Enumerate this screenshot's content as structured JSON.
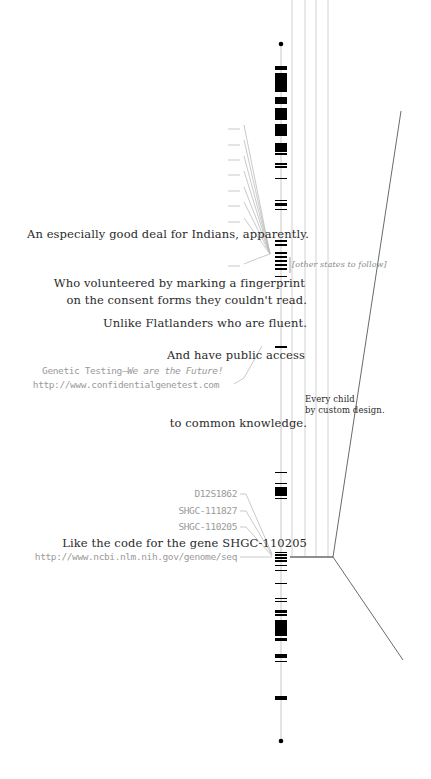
{
  "captions": {
    "indians": "An especially good deal for Indians, apparently.",
    "other_states": "[other states to follow]",
    "volunteered_1": "Who volunteered by marking a fingerprint",
    "volunteered_2": "on the consent forms they couldn't read.",
    "flatlanders": "Unlike Flatlanders who are fluent.",
    "public_access": "And have public access",
    "genetic_testing_prefix": "Genetic Testing—",
    "genetic_testing_slogan": "We are the Future!",
    "genetest_url": "http://www.confidentialgenetest.com",
    "every_child_1": "Every child",
    "every_child_2": "by custom design.",
    "common_knowledge": "to common knowledge.",
    "marker_1": "D12S1862",
    "marker_2": "SHGC-111827",
    "marker_3": "SHGC-110205",
    "gene_code": "Like the code for the gene SHGC-110205",
    "ncbi_url": "http://www.ncbi.nlm.nih.gov/genome/seq"
  },
  "colors": {
    "text": "#2a2a2a",
    "muted": "#9a9a9a",
    "band": "#000000",
    "axis": "#c8c8c8",
    "guide": "#cfcfcf",
    "diagonal": "#6a6a6a"
  },
  "chromosome": {
    "x": 281,
    "top": 44,
    "bottom": 741,
    "bands": [
      [
        66,
        70
      ],
      [
        73,
        92
      ],
      [
        97,
        104
      ],
      [
        108,
        120
      ],
      [
        124,
        136
      ],
      [
        143,
        152
      ],
      [
        153,
        155
      ],
      [
        163,
        165
      ],
      [
        166,
        168
      ],
      [
        178,
        179
      ],
      [
        200,
        201
      ],
      [
        203,
        206
      ],
      [
        209,
        210
      ],
      [
        240,
        242
      ],
      [
        244,
        246
      ],
      [
        252,
        254
      ],
      [
        256,
        258
      ],
      [
        260,
        262
      ],
      [
        264,
        266
      ],
      [
        268,
        270
      ],
      [
        276,
        277
      ],
      [
        346,
        348
      ],
      [
        472,
        473
      ],
      [
        483,
        484
      ],
      [
        487,
        496
      ],
      [
        498,
        499
      ],
      [
        552,
        553
      ],
      [
        554,
        556
      ],
      [
        557,
        559
      ],
      [
        560,
        562
      ],
      [
        565,
        566
      ],
      [
        570,
        571
      ],
      [
        583,
        584
      ],
      [
        598,
        599
      ],
      [
        601,
        602
      ],
      [
        610,
        613
      ],
      [
        614,
        616
      ],
      [
        620,
        636
      ],
      [
        638,
        641
      ],
      [
        654,
        658
      ],
      [
        661,
        662
      ],
      [
        696,
        700
      ]
    ]
  }
}
